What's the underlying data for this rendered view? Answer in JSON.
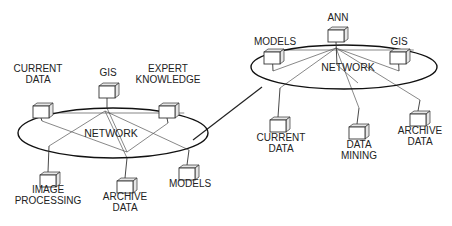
{
  "diagram": {
    "type": "network-topology",
    "networks": [
      {
        "id": "left",
        "label": "NETWORK",
        "center": [
          113,
          133
        ],
        "rx": 95,
        "ry": 25,
        "nodes": [
          {
            "id": "current-data",
            "lines": [
              "CURRENT",
              "DATA"
            ],
            "box": [
              33,
              103
            ],
            "label_pos": [
              38,
              83
            ],
            "attach": [
              42,
              121
            ]
          },
          {
            "id": "gis",
            "lines": [
              "GIS"
            ],
            "box": [
              99,
              83
            ],
            "label_pos": [
              108,
              76
            ],
            "attach": [
              107,
              108
            ]
          },
          {
            "id": "expert-knowledge",
            "lines": [
              "EXPERT",
              "KNOWLEDGE"
            ],
            "box": [
              159,
              103
            ],
            "label_pos": [
              168,
              83
            ],
            "attach": [
              168,
              123
            ]
          },
          {
            "id": "image-processing",
            "lines": [
              "IMAGE",
              "PROCESSING"
            ],
            "box": [
              40,
              172
            ],
            "label_pos": [
              48,
              193
            ],
            "attach": [
              49,
              146
            ]
          },
          {
            "id": "archive-data",
            "lines": [
              "ARCHIVE",
              "DATA"
            ],
            "box": [
              117,
              178
            ],
            "label_pos": [
              125,
              200
            ],
            "attach": [
              127,
              158
            ]
          },
          {
            "id": "models",
            "lines": [
              "MODELS"
            ],
            "box": [
              179,
              165
            ],
            "label_pos": [
              190,
              187
            ],
            "attach": [
              189,
              150
            ]
          }
        ]
      },
      {
        "id": "right",
        "label": "NETWORK",
        "center": [
          344,
          67
        ],
        "rx": 93,
        "ry": 22,
        "nodes": [
          {
            "id": "models",
            "lines": [
              "MODELS"
            ],
            "box": [
              264,
              49
            ],
            "label_pos": [
              275,
              45
            ],
            "attach": [
              273,
              71
            ]
          },
          {
            "id": "ann",
            "lines": [
              "ANN"
            ],
            "box": [
              328,
              27
            ],
            "label_pos": [
              338,
              21
            ],
            "attach": [
              337,
              65
            ]
          },
          {
            "id": "gis",
            "lines": [
              "GIS"
            ],
            "box": [
              390,
              49
            ],
            "label_pos": [
              399,
              45
            ],
            "attach": [
              399,
              71
            ]
          },
          {
            "id": "current-data",
            "lines": [
              "CURRENT",
              "DATA"
            ],
            "box": [
              270,
              117
            ],
            "label_pos": [
              281,
              141
            ],
            "attach": [
              280,
              88
            ]
          },
          {
            "id": "data-mining",
            "lines": [
              "DATA",
              "MINING"
            ],
            "box": [
              349,
              124
            ],
            "label_pos": [
              359,
              148
            ],
            "attach": [
              359,
              108
            ]
          },
          {
            "id": "archive-data",
            "lines": [
              "ARCHIVE",
              "DATA"
            ],
            "box": [
              410,
              111
            ],
            "label_pos": [
              420,
              134
            ],
            "attach": [
              420,
              100
            ]
          }
        ]
      }
    ],
    "interconnect": {
      "from": [
        193,
        140
      ],
      "to": [
        262,
        87
      ]
    }
  }
}
